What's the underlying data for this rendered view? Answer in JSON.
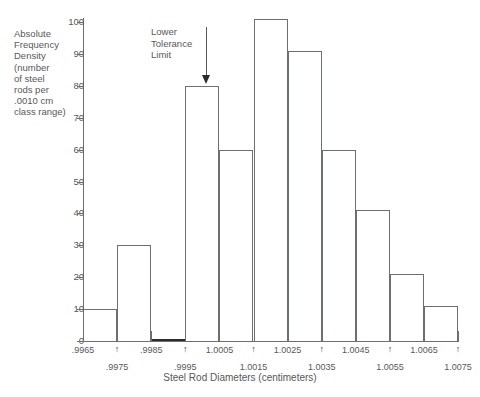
{
  "chart_data": {
    "type": "bar",
    "title": "",
    "subtitle": "",
    "xlabel": "Steel Rod Diameters (centimeters)",
    "ylabel": "Absolute Frequency Density (number of steel rods per .0010 cm class range)",
    "grid": false,
    "legend": null,
    "xlim": [
      0.9965,
      1.0075
    ],
    "ylim": [
      0,
      100
    ],
    "ytick_values": [
      0,
      10,
      20,
      30,
      40,
      50,
      60,
      70,
      80,
      90,
      100
    ],
    "ytick_labels": [
      "0",
      "10",
      "20",
      "30",
      "40",
      "50",
      "60",
      "70",
      "80",
      "90",
      "100"
    ],
    "xtick_values": [
      0.9965,
      0.9975,
      0.9985,
      0.9995,
      1.0005,
      1.0015,
      1.0025,
      1.0035,
      1.0045,
      1.0055,
      1.0065,
      1.0075
    ],
    "xtick_labels": [
      ".9965",
      ".9975",
      ".9985",
      ".9995",
      "1.0005",
      "1.0015",
      "1.0025",
      "1.0035",
      "1.0045",
      "1.0055",
      "1.0065",
      "1.0075"
    ],
    "bin_width": 0.001,
    "bin_edges": [
      0.9965,
      0.9975,
      0.9985,
      0.9995,
      1.0005,
      1.0015,
      1.0025,
      1.0035,
      1.0045,
      1.0055,
      1.0065,
      1.0075
    ],
    "categories": [
      ".9965-.9975",
      ".9975-.9985",
      ".9985-.9995",
      ".9995-1.0005",
      "1.0005-1.0015",
      "1.0015-1.0025",
      "1.0025-1.0035",
      "1.0035-1.0045",
      "1.0045-1.0055",
      "1.0055-1.0065",
      "1.0065-1.0075"
    ],
    "values": [
      10,
      30,
      0,
      80,
      60,
      101,
      91,
      60,
      41,
      21,
      11
    ],
    "annotations": [
      {
        "text": "Lower Tolerance Limit",
        "x": 0.9995,
        "type": "arrow-down"
      }
    ]
  },
  "axes": {
    "y_title_lines": [
      "Absolute",
      "Frequency",
      "Density",
      "(number",
      "of steel",
      "rods per",
      ".0010 cm",
      "class range)"
    ],
    "x_title": "Steel Rod Diameters (centimeters)"
  },
  "annotation": {
    "line1": "Lower",
    "line2": "Tolerance",
    "line3": "Limit",
    "arrow_glyph": "arrow-down-icon"
  },
  "colors": {
    "axis": "#6d6e70",
    "text": "#58585a",
    "bar_stroke": "#6d6e70",
    "bar_fill": "#ffffff",
    "flat_bar": "#2b2b2d",
    "background": "#ffffff"
  }
}
